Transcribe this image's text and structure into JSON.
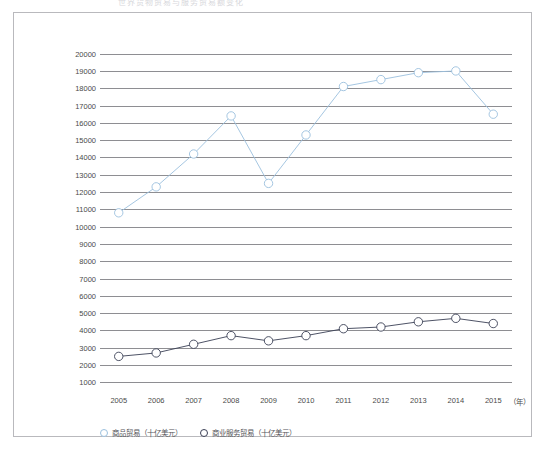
{
  "title_faint": "世界货物贸易与服务贸易额变化",
  "legend": {
    "items": [
      {
        "label": "商品贸易（十亿美元）",
        "color": "#9bc0de"
      },
      {
        "label": "商业服务贸易（十亿美元）",
        "color": "#3a3f55"
      }
    ]
  },
  "axis": {
    "x_unit": "（年）"
  },
  "chart_data": {
    "type": "line",
    "title": "世界货物贸易与服务贸易额变化",
    "xlabel": "（年）",
    "ylabel": "",
    "categories": [
      "2005",
      "2006",
      "2007",
      "2008",
      "2009",
      "2010",
      "2011",
      "2012",
      "2013",
      "2014",
      "2015"
    ],
    "yticks": [
      1000,
      2000,
      3000,
      4000,
      5000,
      6000,
      7000,
      8000,
      9000,
      10000,
      11000,
      12000,
      13000,
      14000,
      15000,
      16000,
      17000,
      18000,
      19000,
      20000
    ],
    "ytick_labels": [
      "1000",
      "2000",
      "3000",
      "4000",
      "5000",
      "6000",
      "7000",
      "8000",
      "9000",
      "10000",
      "11000",
      "12000",
      "13000",
      "14000",
      "15000",
      "16000",
      "17000",
      "18000",
      "19000",
      "20000"
    ],
    "ylim": [
      500,
      20500
    ],
    "grid": true,
    "legend_position": "bottom-left",
    "series": [
      {
        "name": "商品贸易（十亿美元）",
        "color": "#9bc0de",
        "marker": "open-circle",
        "values": [
          10800,
          12300,
          14200,
          16400,
          12500,
          15300,
          18100,
          18500,
          18900,
          19000,
          16500
        ]
      },
      {
        "name": "商业服务贸易（十亿美元）",
        "color": "#3a3f55",
        "marker": "open-circle",
        "values": [
          2500,
          2700,
          3200,
          3700,
          3400,
          3700,
          4100,
          4200,
          4500,
          4700,
          4400
        ]
      }
    ]
  }
}
